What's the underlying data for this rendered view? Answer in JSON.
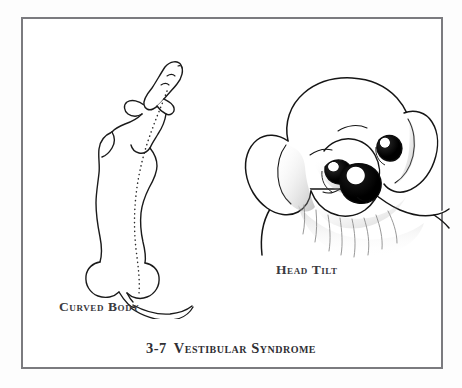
{
  "figure": {
    "caption_number": "3-7",
    "caption_title": "Vestibular Syndrome",
    "frame_color": "#7b7b7f",
    "page_background": "#fdfdfd",
    "plate_background": "#ffffff",
    "text_color": "#2f2f34",
    "label_color": "#3a3a40",
    "ink_color": "#1a1a1a"
  },
  "panels": [
    {
      "id": "curved-body",
      "label": "Curved Body",
      "icon_name": "dog-dorsal-view-curved-spine-illustration",
      "description": "Dog viewed from above with body curved to one side and dotted line marking the spine"
    },
    {
      "id": "head-tilt",
      "label": "Head Tilt",
      "icon_name": "dog-head-tilted-illustration",
      "description": "Labrador retriever puppy head tilted to one side"
    }
  ]
}
